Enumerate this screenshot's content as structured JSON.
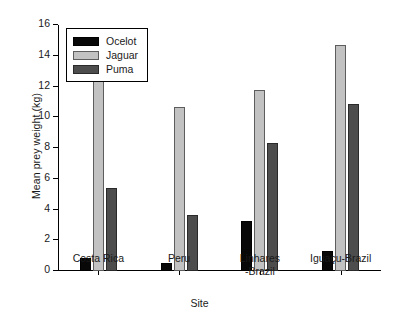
{
  "chart_data": {
    "type": "bar",
    "title": "",
    "xlabel": "Site",
    "ylabel": "Mean prey weight (kg)",
    "categories": [
      "Costa Rica",
      "Peru",
      "Linhares\n-Brazil",
      "Iguaçu-Brazil"
    ],
    "series": [
      {
        "name": "Ocelot",
        "color": "#080808",
        "values": [
          0.85,
          0.5,
          3.25,
          1.3
        ]
      },
      {
        "name": "Jaguar",
        "color": "#c2c2c2",
        "values": [
          12.5,
          10.7,
          11.75,
          14.7
        ]
      },
      {
        "name": "Puma",
        "color": "#4d4d4d",
        "values": [
          5.4,
          3.65,
          8.35,
          10.85
        ]
      }
    ],
    "ylim": [
      0,
      16
    ],
    "yticks": [
      0,
      2,
      4,
      6,
      8,
      10,
      12,
      14,
      16
    ],
    "ytick_labels": [
      "0",
      "2",
      "4",
      "6",
      "8",
      "10",
      "12",
      "14",
      "16"
    ],
    "grid": false,
    "legend_position": "top-left"
  },
  "axes": {
    "y_title": "Mean prey weight (kg)",
    "x_title": "Site"
  },
  "legend": {
    "entries": [
      {
        "label": "Ocelot"
      },
      {
        "label": "Jaguar"
      },
      {
        "label": "Puma"
      }
    ]
  },
  "groups": [
    {
      "label": "Costa Rica"
    },
    {
      "label": "Peru"
    },
    {
      "label": "Linhares\n-Brazil"
    },
    {
      "label": "Iguaçu-Brazil"
    }
  ]
}
